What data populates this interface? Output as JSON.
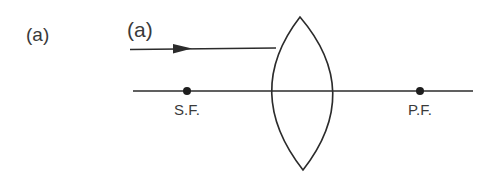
{
  "figure": {
    "outer_label": "(a)",
    "inner_label": "(a)",
    "focus_labels": {
      "secondary": "S.F.",
      "primary": "P.F."
    },
    "colors": {
      "stroke": "#2b2b2b",
      "text": "#3a3a3a",
      "background": "#ffffff"
    },
    "elements": {
      "lens_type": "biconvex-lens",
      "incident_ray": "parallel-ray-with-arrow",
      "principal_axis": "horizontal-line"
    }
  }
}
